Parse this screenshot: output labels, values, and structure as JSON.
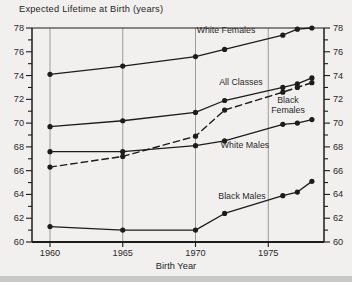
{
  "page": {
    "background": "#f1f0ee",
    "bottom_strip_color": "#c8c8c6"
  },
  "chart_data": {
    "type": "line",
    "title": "Expected Lifetime at Birth (years)",
    "xlabel": "Birth Year",
    "ylabel": "",
    "xlim": [
      1958.8,
      1978.9
    ],
    "ylim": [
      60,
      78
    ],
    "x_tick_labels": [
      "1960",
      "1965",
      "1970",
      "1975"
    ],
    "x_tick_values": [
      1960,
      1965,
      1970,
      1975
    ],
    "y_tick_labels": [
      "60",
      "62",
      "64",
      "66",
      "68",
      "70",
      "72",
      "74",
      "76",
      "78"
    ],
    "y_tick_values": [
      60,
      62,
      64,
      66,
      68,
      70,
      72,
      74,
      76,
      78
    ],
    "y_minor_tick_step": 1,
    "grid": "vertical-gridlines-at-x-ticks",
    "dual_y_axis": true,
    "x": [
      1960,
      1965,
      1970,
      1972,
      1976,
      1977,
      1978
    ],
    "series": [
      {
        "name": "White Females",
        "style": "solid",
        "values": [
          74.1,
          74.8,
          75.6,
          76.2,
          77.4,
          77.9,
          78.0
        ]
      },
      {
        "name": "All Classes",
        "style": "solid",
        "values": [
          69.7,
          70.2,
          70.9,
          71.9,
          73.0,
          73.3,
          73.8
        ]
      },
      {
        "name": "Black Females",
        "style": "dashed",
        "values": [
          66.3,
          67.2,
          68.9,
          71.1,
          72.6,
          73.0,
          73.4
        ]
      },
      {
        "name": "White Males",
        "style": "solid",
        "values": [
          67.6,
          67.6,
          68.1,
          68.5,
          69.9,
          70.0,
          70.3
        ]
      },
      {
        "name": "Black Males",
        "style": "solid",
        "values": [
          61.3,
          61.0,
          61.0,
          62.4,
          63.9,
          64.2,
          65.1
        ]
      }
    ],
    "annotations": [
      {
        "text": "White Females"
      },
      {
        "text": "All Classes"
      },
      {
        "text": "Black\nFemales"
      },
      {
        "text": "White Males"
      },
      {
        "text": "Black Males"
      }
    ],
    "line_color": "#1c1c1c",
    "marker": "filled-circle",
    "grid_color": "#9b9b9b",
    "axis_color": "#1c1c1c",
    "text_color": "#2a2a2a"
  }
}
